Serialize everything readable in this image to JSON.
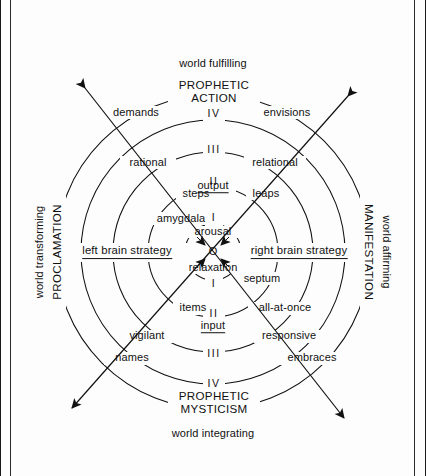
{
  "figure": {
    "type": "concentric-ring-diagram",
    "center": {
      "x": 213,
      "y": 252
    },
    "ring_radii": [
      28,
      65,
      100,
      132,
      157
    ],
    "axis_labels": {
      "top_outer": "world fulfilling",
      "bottom_outer": "world integrating",
      "left_outer": "world transforming",
      "right_outer": "world affirming",
      "left_inner": "PROCLAMATION",
      "right_inner": "MANIFESTATION"
    },
    "poles": {
      "top_title_line1": "PROPHETIC",
      "top_title_line2": "ACTION",
      "bottom_title_line1": "PROPHETIC",
      "bottom_title_line2": "MYSTICISM"
    },
    "ring_numerals_top": [
      "IV",
      "III",
      "II",
      "I"
    ],
    "ring_numerals_bottom": [
      "I",
      "II",
      "III",
      "IV"
    ],
    "flow_labels": {
      "upper": "output",
      "lower": "input"
    },
    "core": {
      "top": "arousal",
      "middle": "O",
      "bottom": "relaxation"
    },
    "hemisphere_strategies": {
      "left": "left brain strategy",
      "right": "right brain strategy"
    },
    "brain_structures": {
      "left": "amygdala",
      "right": "septum"
    },
    "left_ring_terms": [
      "steps",
      "rational",
      "demands",
      "items",
      "vigilant",
      "names"
    ],
    "right_ring_terms": [
      "leaps",
      "relational",
      "envisions",
      "all-at-once",
      "responsive",
      "embraces"
    ],
    "arrows": {
      "count": 2,
      "style": "double-headed-diagonal",
      "directions": [
        "NE-SW",
        "NW-SE"
      ]
    }
  }
}
